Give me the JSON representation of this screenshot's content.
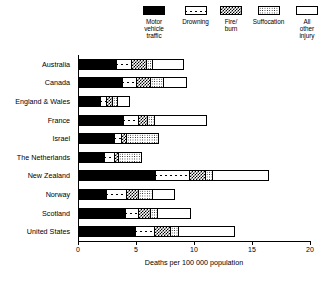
{
  "chart_data": {
    "type": "bar",
    "orientation": "horizontal",
    "stacked": true,
    "title": "",
    "xlabel": "Deaths per 100 000 population",
    "ylabel": "",
    "xlim": [
      0,
      20
    ],
    "xticks": [
      0,
      5,
      10,
      15,
      20
    ],
    "grid": false,
    "legend_position": "top",
    "categories": [
      "Australia",
      "Canada",
      "England & Wales",
      "France",
      "Israel",
      "The Netherlands",
      "New Zealand",
      "Norway",
      "Scotland",
      "United States"
    ],
    "series": [
      {
        "name": "Motor vehicle traffic",
        "legend_label": "Motor\nvehicle\ntraffic",
        "pattern": "solid-black",
        "values": [
          3.4,
          3.9,
          2.0,
          4.0,
          3.2,
          2.3,
          6.8,
          2.5,
          4.2,
          5.0
        ]
      },
      {
        "name": "Drowning",
        "legend_label": "Drowning",
        "pattern": "white-x",
        "values": [
          1.3,
          1.2,
          0.5,
          1.2,
          0.6,
          0.9,
          2.9,
          1.7,
          1.1,
          1.6
        ]
      },
      {
        "name": "Fire/burn",
        "legend_label": "Fire/\nburn",
        "pattern": "dense-checker",
        "values": [
          1.2,
          1.2,
          0.5,
          0.8,
          0.3,
          0.3,
          1.3,
          1.0,
          1.0,
          1.4
        ]
      },
      {
        "name": "Suffocation",
        "legend_label": "Suffocation",
        "pattern": "light-dots",
        "values": [
          0.5,
          1.1,
          0.4,
          0.5,
          2.9,
          2.0,
          0.6,
          1.2,
          0.5,
          0.6
        ]
      },
      {
        "name": "All other injury",
        "legend_label": "All\nother\ninjury",
        "pattern": "white",
        "values": [
          2.7,
          2.0,
          1.1,
          4.6,
          0.0,
          0.0,
          4.9,
          2.0,
          2.9,
          4.9
        ]
      }
    ],
    "totals": [
      9.1,
      9.4,
      4.5,
      11.1,
      7.0,
      5.5,
      16.5,
      8.4,
      9.7,
      13.5
    ]
  }
}
